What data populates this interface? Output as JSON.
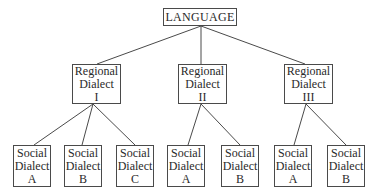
{
  "diagram": {
    "type": "tree",
    "root": {
      "label": "LANGUAGE"
    },
    "regional": [
      {
        "line1": "Regional",
        "line2": "Dialect",
        "numeral": "I",
        "social": [
          {
            "line1": "Social",
            "line2": "Dialect",
            "letter": "A"
          },
          {
            "line1": "Social",
            "line2": "Dialect",
            "letter": "B"
          },
          {
            "line1": "Social",
            "line2": "Dialect",
            "letter": "C"
          }
        ]
      },
      {
        "line1": "Regional",
        "line2": "Dialect",
        "numeral": "II",
        "social": [
          {
            "line1": "Social",
            "line2": "Dialect",
            "letter": "A"
          },
          {
            "line1": "Social",
            "line2": "Dialect",
            "letter": "B"
          }
        ]
      },
      {
        "line1": "Regional",
        "line2": "Dialect",
        "numeral": "III",
        "social": [
          {
            "line1": "Social",
            "line2": "Dialect",
            "letter": "A"
          },
          {
            "line1": "Social",
            "line2": "Dialect",
            "letter": "B"
          }
        ]
      }
    ]
  },
  "colors": {
    "line": "#4a4a4a",
    "box_border": "#4a4a4a",
    "text": "#2a2a2a",
    "background": "#ffffff"
  }
}
